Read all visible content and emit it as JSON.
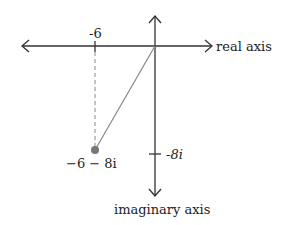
{
  "diagram": {
    "axes": {
      "real_label": "real axis",
      "imaginary_label": "imaginary axis"
    },
    "ticks": {
      "real_tick_label": "-6",
      "imag_tick_label": "-8i"
    },
    "point": {
      "label": "−6 − 8i",
      "real": -6,
      "imag": -8,
      "color": "#777777"
    },
    "colors": {
      "axis": "#333333",
      "segment": "#888888",
      "dashed": "#888888"
    }
  }
}
